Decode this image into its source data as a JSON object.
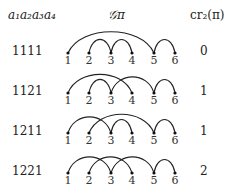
{
  "headers": {
    "word": "a₁a₂a₃a₄",
    "graph": "𝒢π",
    "crossings": "cr₂(π)"
  },
  "node_labels": [
    "1",
    "2",
    "3",
    "4",
    "5",
    "6"
  ],
  "rows": [
    {
      "word": "1111",
      "arcs": [
        [
          1,
          5
        ],
        [
          2,
          3
        ],
        [
          3,
          4
        ],
        [
          5,
          6
        ]
      ],
      "cr": "0"
    },
    {
      "word": "1121",
      "arcs": [
        [
          1,
          4
        ],
        [
          2,
          3
        ],
        [
          3,
          5
        ],
        [
          5,
          6
        ]
      ],
      "cr": "1"
    },
    {
      "word": "1211",
      "arcs": [
        [
          1,
          3
        ],
        [
          2,
          5
        ],
        [
          3,
          4
        ],
        [
          5,
          6
        ]
      ],
      "cr": "1"
    },
    {
      "word": "1221",
      "arcs": [
        [
          1,
          3
        ],
        [
          2,
          4
        ],
        [
          3,
          5
        ],
        [
          5,
          6
        ]
      ],
      "cr": "2"
    }
  ]
}
